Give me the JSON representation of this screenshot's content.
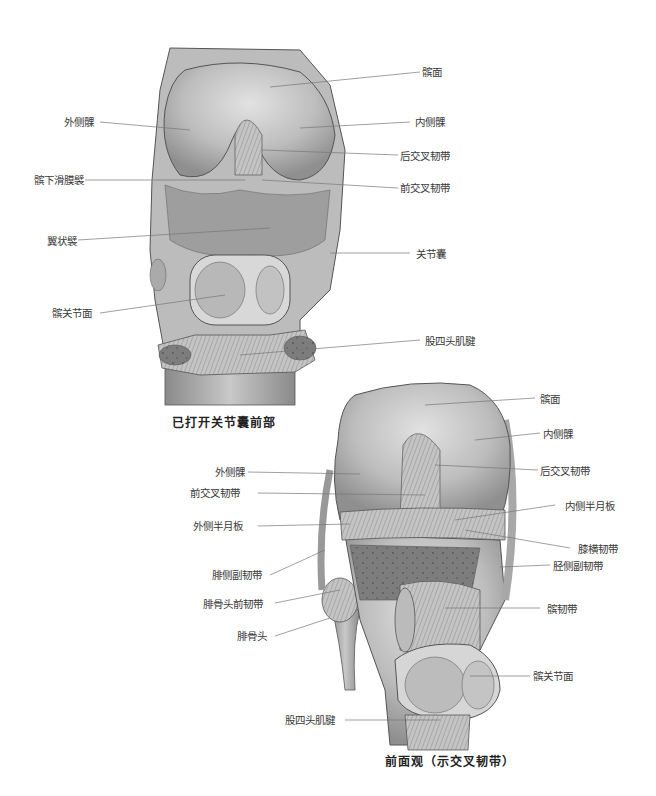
{
  "figure_top": {
    "caption": "已打开关节囊前部",
    "labels": {
      "patellar_surface": "髌面",
      "lateral_condyle": "外侧髁",
      "medial_condyle": "内侧髁",
      "pcl": "后交叉韧带",
      "infrapatellar_synovial_fold": "髌下滑膜襞",
      "acl": "前交叉韧带",
      "alar_folds": "翼状襞",
      "joint_capsule": "关节囊",
      "patellar_articular_surface": "髌关节面",
      "quadriceps_tendon": "股四头肌腱"
    }
  },
  "figure_bottom": {
    "caption": "前面观（示交叉韧带）",
    "labels": {
      "patellar_surface": "髌面",
      "medial_condyle": "内侧髁",
      "lateral_condyle": "外侧髁",
      "pcl": "后交叉韧带",
      "acl": "前交叉韧带",
      "medial_meniscus": "内侧半月板",
      "lateral_meniscus": "外侧半月板",
      "transverse_ligament": "膝横韧带",
      "fibular_collateral": "腓侧副韧带",
      "tibial_collateral": "胫侧副韧带",
      "anterior_fibular_head_ligament": "腓骨头前韧带",
      "patellar_ligament": "髌韧带",
      "fibular_head": "腓骨头",
      "patellar_articular_surface": "髌关节面",
      "quadriceps_tendon": "股四头肌腱"
    }
  },
  "colors": {
    "line": "#777777",
    "bone_light": "#d6d6d6",
    "bone_mid": "#b5b5b5",
    "bone_dark": "#8a8a8a",
    "outline": "#555555"
  }
}
